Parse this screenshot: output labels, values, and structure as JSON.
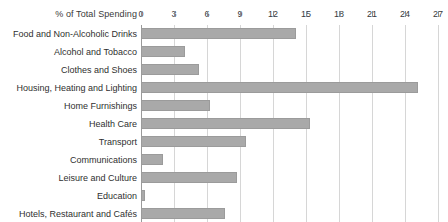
{
  "chart_data": {
    "type": "bar",
    "orientation": "horizontal",
    "title": "",
    "xlabel": "% of Total Spending",
    "ylabel": "",
    "xlim": [
      0,
      27
    ],
    "xticks": [
      0,
      3,
      6,
      9,
      12,
      15,
      18,
      21,
      24,
      27
    ],
    "grid": true,
    "legend": null,
    "bar_color": "#a9a9a9",
    "categories": [
      "Food and Non-Alcoholic Drinks",
      "Alcohol and Tobacco",
      "Clothes and Shoes",
      "Housing, Heating and Lighting",
      "Home Furnishings",
      "Health Care",
      "Transport",
      "Communications",
      "Leisure and Culture",
      "Education",
      "Hotels, Restaurant and Cafés"
    ],
    "values": [
      14.1,
      4.0,
      5.3,
      25.2,
      6.3,
      15.4,
      9.5,
      2.0,
      8.7,
      0.4,
      7.6
    ]
  }
}
